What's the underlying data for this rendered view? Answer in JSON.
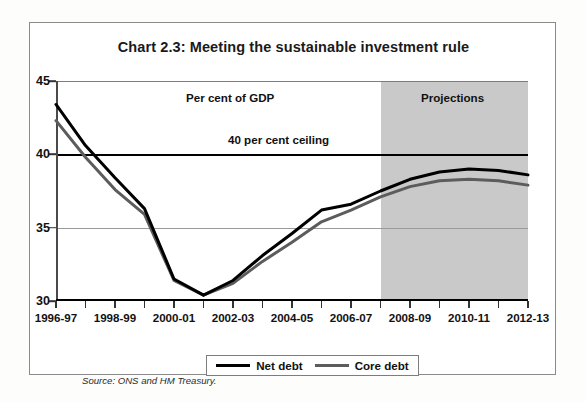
{
  "chart_data": {
    "type": "line",
    "title": "Chart 2.3: Meeting the sustainable investment rule",
    "xlabel": "",
    "ylabel": "Per cent of GDP",
    "ylim": [
      30,
      45
    ],
    "xlim": [
      "1996-97",
      "2012-13"
    ],
    "yticks": [
      30,
      35,
      40,
      45
    ],
    "grid": true,
    "legend_position": "bottom-center",
    "x": [
      "1996-97",
      "1997-98",
      "1998-99",
      "1999-00",
      "2000-01",
      "2001-02",
      "2002-03",
      "2003-04",
      "2004-05",
      "2005-06",
      "2006-07",
      "2007-08",
      "2008-09",
      "2009-10",
      "2010-11",
      "2011-12",
      "2012-13"
    ],
    "xtick_labels": [
      "1996-97",
      "1998-99",
      "2000-01",
      "2002-03",
      "2004-05",
      "2006-07",
      "2008-09",
      "2010-11",
      "2012-13"
    ],
    "series": [
      {
        "name": "Net debt",
        "color": "#000000",
        "values": [
          43.4,
          40.6,
          38.4,
          36.3,
          31.5,
          30.4,
          31.4,
          33.1,
          34.6,
          36.2,
          36.6,
          37.5,
          38.3,
          38.8,
          39.0,
          38.9,
          38.6
        ]
      },
      {
        "name": "Core debt",
        "color": "#5c5c5c",
        "values": [
          42.3,
          39.8,
          37.6,
          35.9,
          31.4,
          30.4,
          31.2,
          32.7,
          34.0,
          35.4,
          36.2,
          37.1,
          37.8,
          38.2,
          38.3,
          38.2,
          37.9
        ]
      }
    ],
    "annotations": [
      {
        "id": "percent-of-gdp",
        "text": "Per cent of GDP"
      },
      {
        "id": "projections",
        "text": "Projections"
      },
      {
        "id": "ceiling",
        "text": "40 per cent ceiling"
      }
    ],
    "reference_lines": [
      {
        "id": "forty-per-cent-ceiling",
        "value": 40,
        "label": "40 per cent ceiling",
        "color": "#000000"
      }
    ],
    "shaded_regions": [
      {
        "id": "projections-band",
        "from": "2007-08",
        "to": "2012-13",
        "label": "Projections",
        "color": "#c9c9c9"
      }
    ],
    "source": "Source: ONS and HM Treasury."
  },
  "legend": {
    "entries": [
      {
        "label": "Net debt"
      },
      {
        "label": "Core debt"
      }
    ]
  },
  "ytick_labels": [
    "45",
    "40",
    "35",
    "30"
  ],
  "colors": {
    "net_debt": "#000000",
    "core_debt": "#5c5c5c",
    "projection_band": "#c9c9c9",
    "gridline": "#9a9a9a",
    "panel_border": "#8a8a8a"
  }
}
